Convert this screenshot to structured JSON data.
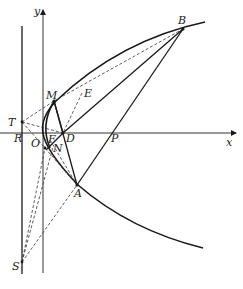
{
  "diagram": {
    "type": "parabola-geometry-figure",
    "colors": {
      "stroke": "#1a1a1a",
      "background": "#ffffff"
    },
    "axes": {
      "x_label": "x",
      "y_label": "y"
    },
    "points": {
      "B": "B",
      "M": "M",
      "E": "E",
      "T": "T",
      "R": "R",
      "O": "O",
      "F": "F",
      "D": "D",
      "N": "N",
      "P": "P",
      "A": "A",
      "S": "S"
    },
    "curves": [
      "parabola opening right with vertex at O",
      "arc from M to N"
    ],
    "solid_segments": [
      "M-D",
      "M-B",
      "D-B",
      "A-B",
      "D-A (through N region)",
      "M-N"
    ],
    "dashed_segments": [
      "T-M",
      "M-E",
      "T-D",
      "T-O",
      "E-D",
      "S-M",
      "S-N",
      "S-A",
      "N-A",
      "F-A"
    ],
    "vertical_lines": [
      "directrix through T, R, S",
      "y-axis"
    ]
  }
}
